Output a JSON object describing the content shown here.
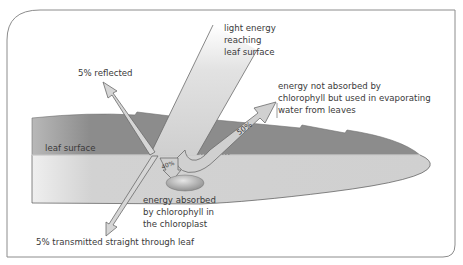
{
  "diagram": {
    "labels": {
      "light_incoming": [
        "light energy",
        "reaching",
        "leaf surface"
      ],
      "reflected": "5% reflected",
      "evaporating": [
        "energy not absorbed by",
        "chlorophyll but used in evaporating",
        "water from leaves"
      ],
      "leaf_surface": "leaf surface",
      "absorbed": [
        "energy absorbed",
        "by chlorophyll in",
        "the chloroplast"
      ],
      "transmitted": "5% transmitted straight through leaf"
    },
    "percentages": {
      "evaporation": "50%",
      "absorbed": "40%"
    },
    "colors": {
      "frame": "#8c8c8c",
      "leaf_upper": "#8f8f8f",
      "leaf_lower": "#d2d2d2",
      "arrow_fill": "#d6d6d6",
      "arrow_stroke": "#6b6b6b",
      "chloroplast": "#9a9a9a",
      "text": "#3a3a3a"
    }
  }
}
